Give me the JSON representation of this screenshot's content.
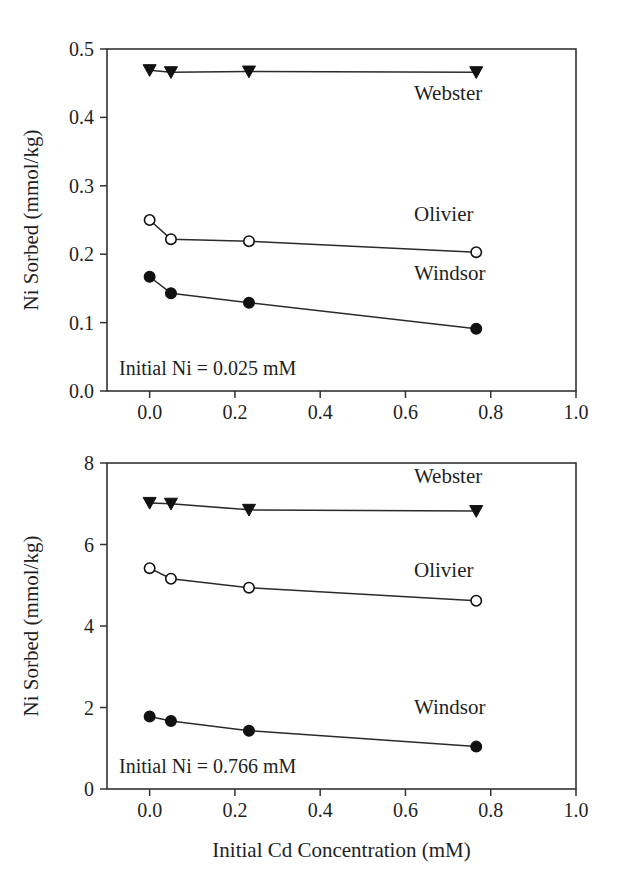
{
  "figure": {
    "background_color": "#ffffff",
    "ink_color": "#1f1f1f",
    "x_axis_title": "Initial Cd Concentration (mM)"
  },
  "chart_data": [
    {
      "type": "line",
      "panel": "top",
      "title": "",
      "xlabel": "",
      "ylabel": "Ni Sorbed (mmol/kg)",
      "xlim": [
        -0.1,
        1.0
      ],
      "ylim": [
        0.0,
        0.5
      ],
      "xticks": [
        0.0,
        0.2,
        0.4,
        0.6,
        0.8,
        1.0
      ],
      "xticklabels": [
        "0.0",
        "0.2",
        "0.4",
        "0.6",
        "0.8",
        "1.0"
      ],
      "yticks": [
        0.0,
        0.1,
        0.2,
        0.3,
        0.4,
        0.5
      ],
      "yticklabels": [
        "0.0",
        "0.1",
        "0.2",
        "0.3",
        "0.4",
        "0.5"
      ],
      "grid": false,
      "legend_position": "inline-right",
      "annotation": "Initial Ni = 0.025 mM",
      "x": [
        0.0,
        0.05,
        0.233,
        0.766
      ],
      "series": [
        {
          "name": "Webster",
          "marker": "filled-triangle-down",
          "label_x": 0.62,
          "label_y": 0.425,
          "values": [
            0.469,
            0.466,
            0.467,
            0.466
          ]
        },
        {
          "name": "Olivier",
          "marker": "open-circle",
          "label_x": 0.62,
          "label_y": 0.248,
          "values": [
            0.25,
            0.222,
            0.219,
            0.203
          ]
        },
        {
          "name": "Windsor",
          "marker": "filled-circle",
          "label_x": 0.62,
          "label_y": 0.163,
          "values": [
            0.167,
            0.143,
            0.129,
            0.091
          ]
        }
      ]
    },
    {
      "type": "line",
      "panel": "bottom",
      "title": "",
      "xlabel": "Initial Cd Concentration (mM)",
      "ylabel": "Ni Sorbed (mmol/kg)",
      "xlim": [
        -0.1,
        1.0
      ],
      "ylim": [
        0,
        8
      ],
      "xticks": [
        0.0,
        0.2,
        0.4,
        0.6,
        0.8,
        1.0
      ],
      "xticklabels": [
        "0.0",
        "0.2",
        "0.4",
        "0.6",
        "0.8",
        "1.0"
      ],
      "yticks": [
        0,
        2,
        4,
        6,
        8
      ],
      "yticklabels": [
        "0",
        "2",
        "4",
        "6",
        "8"
      ],
      "grid": false,
      "legend_position": "inline-right",
      "annotation": "Initial Ni = 0.766 mM",
      "x": [
        0.0,
        0.05,
        0.233,
        0.766
      ],
      "series": [
        {
          "name": "Webster",
          "marker": "filled-triangle-down",
          "label_x": 0.62,
          "label_y": 7.5,
          "values": [
            7.02,
            7.0,
            6.85,
            6.82
          ]
        },
        {
          "name": "Olivier",
          "marker": "open-circle",
          "label_x": 0.62,
          "label_y": 5.2,
          "values": [
            5.42,
            5.16,
            4.94,
            4.62
          ]
        },
        {
          "name": "Windsor",
          "marker": "filled-circle",
          "label_x": 0.62,
          "label_y": 1.85,
          "values": [
            1.78,
            1.67,
            1.43,
            1.04
          ]
        }
      ]
    }
  ]
}
